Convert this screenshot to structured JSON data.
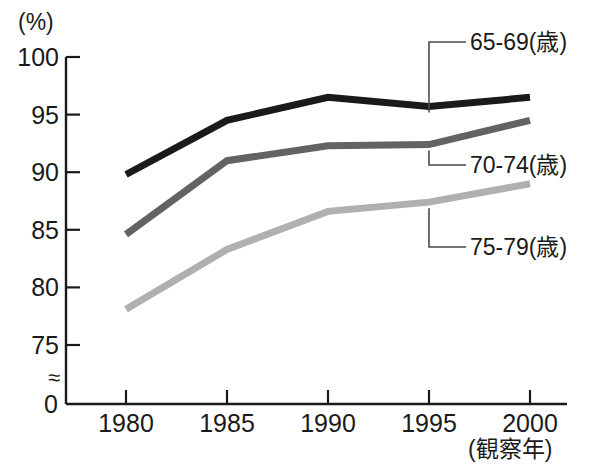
{
  "chart_data": {
    "type": "line",
    "title": "",
    "xlabel": "(観察年)",
    "ylabel": "(%)",
    "x": [
      1980,
      1985,
      1990,
      1995,
      2000
    ],
    "categories": [
      "1980",
      "1985",
      "1990",
      "1995",
      "2000"
    ],
    "ylim": [
      75,
      100
    ],
    "y_axis_break": true,
    "y_axis_break_symbol": "≈",
    "y_origin_label": "0",
    "yticks": [
      75,
      80,
      85,
      90,
      95,
      100
    ],
    "ytick_labels": [
      "75",
      "80",
      "85",
      "90",
      "95",
      "100"
    ],
    "grid": false,
    "legend_position": "right-inline-leader-lines",
    "series": [
      {
        "name": "65-69(歳)",
        "color": "#1a1a1a",
        "values": [
          89.8,
          94.5,
          96.5,
          95.7,
          96.5
        ]
      },
      {
        "name": "70-74(歳)",
        "color": "#636363",
        "values": [
          84.6,
          91.0,
          92.3,
          92.4,
          94.5
        ]
      },
      {
        "name": "75-79(歳)",
        "color": "#b0b0b0",
        "values": [
          78.1,
          83.3,
          86.6,
          87.4,
          89.0
        ]
      }
    ]
  },
  "axes": {
    "y_unit_label": "(%)",
    "x_axis_caption": "(観察年)",
    "zero_label": "0",
    "break_glyph": "≈"
  },
  "annotations": [
    {
      "label": "65-69(歳)",
      "key": "s0"
    },
    {
      "label": "70-74(歳)",
      "key": "s1"
    },
    {
      "label": "75-79(歳)",
      "key": "s2"
    }
  ]
}
